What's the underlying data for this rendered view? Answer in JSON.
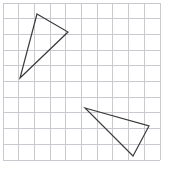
{
  "figure": {
    "title": "",
    "width": 170,
    "height": 171,
    "background_color": "#ffffff",
    "grid": {
      "visible": true,
      "line_color": "#c9c9cf",
      "line_width": 1,
      "cell_size": 15.7,
      "origin_x": 3,
      "origin_y": 3,
      "columns": 10,
      "rows": 10,
      "x_lines": [
        3,
        18.7,
        34.4,
        50.1,
        65.8,
        81.5,
        97.2,
        112.9,
        128.6,
        144.3,
        160
      ],
      "y_lines": [
        3,
        18.7,
        34.4,
        50.1,
        65.8,
        81.5,
        97.2,
        112.9,
        128.6,
        144.3,
        160
      ]
    },
    "shapes": [
      {
        "name": "upper-left-triangle",
        "type": "triangle",
        "stroke_color": "#3a3a3a",
        "stroke_width": 1.2,
        "fill": "none",
        "points": "37,14 68,32 20,78",
        "vertices": [
          {
            "label": "apex",
            "x": 37,
            "y": 14
          },
          {
            "label": "right",
            "x": 68,
            "y": 32
          },
          {
            "label": "bottom-left",
            "x": 20,
            "y": 78
          }
        ]
      },
      {
        "name": "lower-right-triangle",
        "type": "triangle",
        "stroke_color": "#3a3a3a",
        "stroke_width": 1.2,
        "fill": "none",
        "points": "85,108 149,126 133,156",
        "vertices": [
          {
            "label": "left",
            "x": 85,
            "y": 108
          },
          {
            "label": "right",
            "x": 149,
            "y": 126
          },
          {
            "label": "bottom",
            "x": 133,
            "y": 156
          }
        ]
      }
    ]
  },
  "chart_data": {
    "type": "scatter",
    "title": "",
    "xlabel": "",
    "ylabel": "",
    "xlim": [
      0,
      10
    ],
    "ylim": [
      0,
      10
    ],
    "grid": true,
    "legend": "none",
    "series": [
      {
        "name": "Triangle A",
        "closed": true,
        "x": [
          2.17,
          4.14,
          1.08
        ],
        "y": [
          9.3,
          8.15,
          5.22
        ]
      },
      {
        "name": "Triangle B",
        "closed": true,
        "x": [
          5.22,
          9.3,
          8.28
        ],
        "y": [
          3.31,
          2.17,
          0.25
        ]
      }
    ]
  }
}
